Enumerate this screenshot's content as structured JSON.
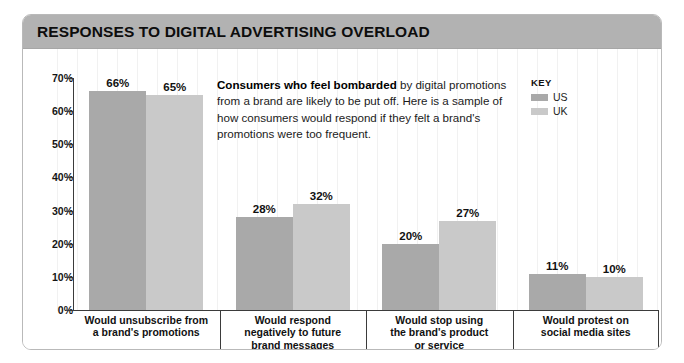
{
  "header": {
    "title": "RESPONSES TO DIGITAL ADVERTISING OVERLOAD"
  },
  "annotation": {
    "bold_lead": "Consumers who feel bombarded",
    "rest": " by digital promotions from a brand are likely to be put off. Here is a sample of how consumers would respond if they felt a brand's promotions were too frequent."
  },
  "legend": {
    "title": "KEY",
    "entries": [
      {
        "label": "US",
        "color": "#a9a9a9"
      },
      {
        "label": "UK",
        "color": "#c9c9c9"
      }
    ]
  },
  "chart_data": {
    "type": "bar",
    "title": "RESPONSES TO DIGITAL ADVERTISING OVERLOAD",
    "xlabel": "",
    "ylabel": "",
    "ylim": [
      0,
      70
    ],
    "ytick_labels": [
      "70%",
      "60%",
      "50%",
      "40%",
      "30%",
      "20%",
      "10%",
      "0%"
    ],
    "ytick_values": [
      70,
      60,
      50,
      40,
      30,
      20,
      10,
      0
    ],
    "grid": "faint-vertical",
    "legend_position": "top-right",
    "categories": [
      "Would unsubscribe from a brand's promotions",
      "Would respond negatively to future brand messages",
      "Would stop using the brand's product or service",
      "Would protest on social media sites"
    ],
    "category_lines": [
      [
        "Would unsubscribe from",
        "a brand's promotions"
      ],
      [
        "Would respond",
        "negatively to future",
        "brand messages"
      ],
      [
        "Would stop using",
        "the brand's product",
        "or service"
      ],
      [
        "Would protest on",
        "social media sites"
      ]
    ],
    "series": [
      {
        "name": "US",
        "color": "#a9a9a9",
        "values": [
          66,
          28,
          20,
          11
        ],
        "labels": [
          "66%",
          "28%",
          "20%",
          "11%"
        ]
      },
      {
        "name": "UK",
        "color": "#c9c9c9",
        "values": [
          65,
          32,
          27,
          10
        ],
        "labels": [
          "65%",
          "32%",
          "27%",
          "10%"
        ]
      }
    ]
  }
}
